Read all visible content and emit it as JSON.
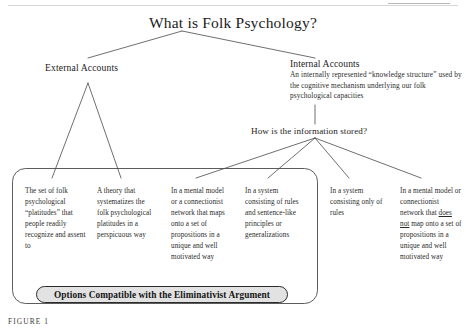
{
  "figure": {
    "title": "What is Folk Psychology?",
    "caption": "FIGURE 1"
  },
  "nodes": {
    "external_accounts": {
      "label": "External Accounts"
    },
    "internal_accounts": {
      "label": "Internal Accounts",
      "description": "An internally represented “knowledge structure” used by the cognitive mechanism underlying our folk psychological capacities"
    },
    "how_stored": {
      "label": "How is the information stored?"
    }
  },
  "leaves": [
    {
      "id": "leaf-0",
      "text": "The set of folk psychological “platitudes” that people readily recognize and assent to"
    },
    {
      "id": "leaf-1",
      "text": "A theory that systematizes the folk psychological platitudes in a perspicuous way"
    },
    {
      "id": "leaf-2",
      "text": "In a mental model or a connectionist network that maps onto a set of propositions in a unique and well motivated way"
    },
    {
      "id": "leaf-3",
      "text": "In a system consisting of rules and sentence-like principles or generalizations"
    },
    {
      "id": "leaf-4",
      "text": "In a system consisting only of rules"
    },
    {
      "id": "leaf-5_pre",
      "text": "In a mental model or connectionist network that "
    },
    {
      "id": "leaf-5_underlined",
      "text": "does not"
    },
    {
      "id": "leaf-5_post",
      "text": " map onto a set of propositions in a unique and well motivated way"
    }
  ],
  "enclosure": {
    "pill_label": "Options Compatible with the Eliminativist Argument"
  },
  "colors": {
    "line": "#4a4a4a",
    "text": "#1a1a1a",
    "pill_fill": "#e2e2e2",
    "pill_border": "#2b2b2b"
  }
}
